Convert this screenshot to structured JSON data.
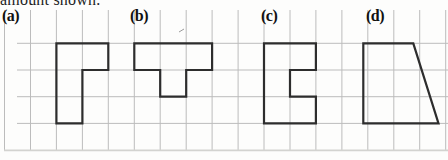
{
  "heading": {
    "text": "amount shown."
  },
  "figures": [
    {
      "id": "a",
      "label": "(a)",
      "shape_name": "l-shape",
      "cells": 4,
      "points": [
        [
          56.4,
          43.3
        ],
        [
          108.3,
          43.3
        ],
        [
          108.3,
          70
        ],
        [
          82.4,
          70
        ],
        [
          82.4,
          123.4
        ],
        [
          56.4,
          123.4
        ]
      ]
    },
    {
      "id": "b",
      "label": "(b)",
      "shape_name": "t-shape",
      "cells": 4,
      "points": [
        [
          134.3,
          43.3
        ],
        [
          212.1,
          43.3
        ],
        [
          212.1,
          70
        ],
        [
          186.2,
          70
        ],
        [
          186.2,
          96.7
        ],
        [
          160.2,
          96.7
        ],
        [
          160.2,
          70
        ],
        [
          134.3,
          70
        ]
      ]
    },
    {
      "id": "c",
      "label": "(c)",
      "shape_name": "c-shape-notched-rectangle",
      "cells": 5,
      "points": [
        [
          264,
          43.3
        ],
        [
          315.9,
          43.3
        ],
        [
          315.9,
          70
        ],
        [
          290,
          70
        ],
        [
          290,
          96.7
        ],
        [
          315.9,
          96.7
        ],
        [
          315.9,
          123.4
        ],
        [
          264,
          123.4
        ]
      ]
    },
    {
      "id": "d",
      "label": "(d)",
      "shape_name": "right-trapezoid",
      "cells": 7.5,
      "points": [
        [
          363.3,
          43.3
        ],
        [
          413.3,
          43.3
        ],
        [
          438.5,
          123.4
        ],
        [
          363.3,
          123.4
        ]
      ]
    }
  ],
  "grid": {
    "color": "#bcbcbc",
    "faint_color": "#d3d3d0",
    "vertical_x": [
      4.5,
      30.5,
      56.4,
      82.4,
      108.3,
      134.3,
      160.2,
      186.2,
      212.1,
      238.1,
      264,
      290,
      315.9,
      341.9,
      367.8,
      393.8,
      419.7,
      445.7
    ],
    "vertical_y_top": 10,
    "vertical_y_bottom": 151,
    "horizontal_y": [
      43.3,
      70,
      96.7,
      123.4
    ],
    "horizontal_x_start": 17,
    "horizontal_x_end": 448,
    "faint_horizontal_y": 150.3
  },
  "stroke": {
    "color": "#2d2d2d",
    "width": 2.2
  },
  "artifact": {
    "x1": 179,
    "y1": 32,
    "x2": 184,
    "y2": 29,
    "color": "#9a9a9a"
  },
  "canvas": {
    "width": 448,
    "height": 160,
    "background": "#fdfdfc"
  }
}
